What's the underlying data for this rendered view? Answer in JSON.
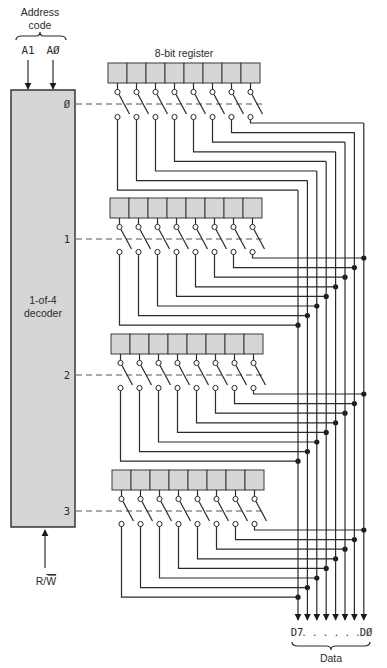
{
  "address": {
    "title_line1": "Address",
    "title_line2": "code",
    "inputs": [
      "A1",
      "AØ"
    ]
  },
  "decoder": {
    "label_line1": "1-of-4",
    "label_line2": "decoder",
    "outputs": [
      "Ø",
      "1",
      "2",
      "3"
    ],
    "control_input": "R/W",
    "control_main": "R/",
    "control_overbar": "W"
  },
  "register": {
    "title": "8-bit register",
    "bits": 8,
    "count": 4
  },
  "data_bus": {
    "msb_label": "D7",
    "dots": ". . . . . .",
    "lsb_label": "DØ",
    "title": "Data"
  },
  "colors": {
    "fill": "#d6d6d6",
    "line": "#2a2a2a"
  }
}
